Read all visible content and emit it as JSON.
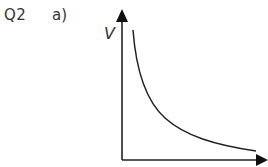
{
  "question": {
    "number": "Q2",
    "part": "a)"
  },
  "graph": {
    "y_axis_label": "V",
    "x_axis_label": "",
    "curve_type": "inverse proportional decay"
  }
}
